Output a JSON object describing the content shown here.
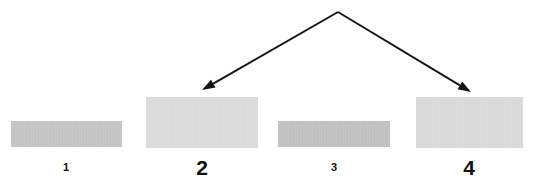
{
  "figure": {
    "background_color": "#ffffff",
    "width": 541,
    "height": 186,
    "ink_color": "#111111"
  },
  "bands": [
    {
      "label": "1",
      "label_size": "small",
      "color": "#c6c6c6",
      "x": 11,
      "y": 121,
      "width": 111,
      "height": 26,
      "label_x": 66,
      "label_y": 162,
      "intensity": "medium"
    },
    {
      "label": "2",
      "label_size": "large",
      "color": "#dddddd",
      "x": 146,
      "y": 97,
      "width": 112,
      "height": 51,
      "label_x": 202,
      "label_y": 157,
      "intensity": "light"
    },
    {
      "label": "3",
      "label_size": "small",
      "color": "#c3c3c3",
      "x": 278,
      "y": 121,
      "width": 112,
      "height": 26,
      "label_x": 334,
      "label_y": 162,
      "intensity": "medium"
    },
    {
      "label": "4",
      "label_size": "large",
      "color": "#dcdcdc",
      "x": 416,
      "y": 97,
      "width": 107,
      "height": 51,
      "label_x": 469,
      "label_y": 157,
      "intensity": "light"
    }
  ],
  "annotation": {
    "type": "double-headed-pointer",
    "apex_x": 338,
    "apex_y": 12,
    "left_tip_x": 202,
    "left_tip_y": 90,
    "right_tip_x": 471,
    "right_tip_y": 92,
    "stroke_color": "#141414",
    "stroke_width": 2,
    "arrowhead_length": 13,
    "arrowhead_width": 9,
    "points_to": [
      "2",
      "4"
    ]
  }
}
